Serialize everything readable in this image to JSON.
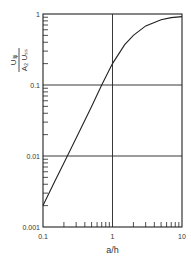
{
  "chart_data": {
    "type": "line",
    "title": "",
    "xlabel": "a/h",
    "ylabel_num": "U_{iφ}",
    "ylabel_den": "A_2 U_{SS}",
    "xscale": "log",
    "yscale": "log",
    "xlim": [
      0.1,
      10
    ],
    "ylim": [
      0.001,
      1
    ],
    "x_ticks": [
      "0.1",
      "1",
      "10"
    ],
    "y_ticks": [
      "0.001",
      "0.01",
      "0.1",
      "1"
    ],
    "grid": true,
    "series": [
      {
        "name": "curve",
        "x": [
          0.1,
          0.15,
          0.2,
          0.3,
          0.5,
          0.7,
          1.0,
          1.5,
          2,
          3,
          5,
          7,
          10
        ],
        "y": [
          0.002,
          0.0045,
          0.008,
          0.018,
          0.05,
          0.1,
          0.2,
          0.37,
          0.5,
          0.68,
          0.83,
          0.89,
          0.92
        ]
      }
    ]
  }
}
